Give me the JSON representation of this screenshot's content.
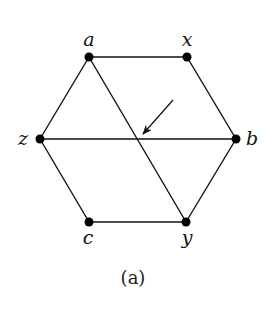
{
  "diagram": {
    "caption": "(a)",
    "nodes": [
      {
        "id": "a",
        "label": "a",
        "x": 89,
        "y": 57,
        "lx": 89,
        "ly": 46
      },
      {
        "id": "x",
        "label": "x",
        "x": 187,
        "y": 57,
        "lx": 187,
        "ly": 46
      },
      {
        "id": "z",
        "label": "z",
        "x": 40,
        "y": 139,
        "lx": 23,
        "ly": 145
      },
      {
        "id": "b",
        "label": "b",
        "x": 236,
        "y": 139,
        "lx": 252,
        "ly": 145
      },
      {
        "id": "c",
        "label": "c",
        "x": 89,
        "y": 222,
        "lx": 88,
        "ly": 244
      },
      {
        "id": "y",
        "label": "y",
        "x": 186,
        "y": 222,
        "lx": 187,
        "ly": 244
      }
    ],
    "edges": [
      [
        "a",
        "x"
      ],
      [
        "a",
        "z"
      ],
      [
        "a",
        "y"
      ],
      [
        "x",
        "b"
      ],
      [
        "z",
        "b"
      ],
      [
        "z",
        "c"
      ],
      [
        "c",
        "y"
      ],
      [
        "y",
        "b"
      ]
    ],
    "arrow": {
      "from": [
        173,
        100
      ],
      "to": [
        143,
        134
      ]
    },
    "colors": {
      "stroke": "#111111",
      "node": "#000000"
    }
  }
}
